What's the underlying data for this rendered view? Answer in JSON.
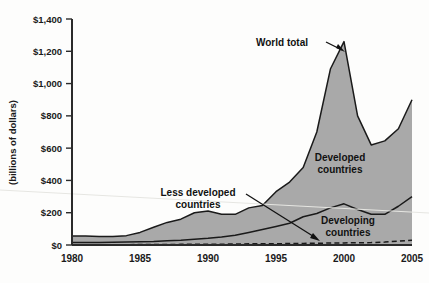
{
  "chart_data": {
    "type": "area",
    "title": "",
    "subtitle": "",
    "xlabel": "",
    "ylabel": "(billions of dollars)",
    "xlim": [
      1980,
      2005
    ],
    "ylim": [
      0,
      1400
    ],
    "grid": false,
    "legend_position": "inline-annotations",
    "stacked": true,
    "x": [
      1980,
      1981,
      1982,
      1983,
      1984,
      1985,
      1986,
      1987,
      1988,
      1989,
      1990,
      1991,
      1992,
      1993,
      1994,
      1995,
      1996,
      1997,
      1998,
      1999,
      2000,
      2001,
      2002,
      2003,
      2004,
      2005
    ],
    "y_tick_labels": [
      "$0",
      "$200",
      "$400",
      "$600",
      "$800",
      "$1,000",
      "$1,200",
      "$1,400"
    ],
    "y_tick_values": [
      0,
      200,
      400,
      600,
      800,
      1000,
      1200,
      1400
    ],
    "x_tick_labels": [
      "1980",
      "1985",
      "1990",
      "1995",
      "2000",
      "2005"
    ],
    "x_tick_values": [
      1980,
      1985,
      1990,
      1995,
      2000,
      2005
    ],
    "series": [
      {
        "name": "World total",
        "style": "solid-line-filled-area",
        "fill": "#a9a9a9",
        "values": [
          55,
          55,
          52,
          52,
          58,
          78,
          110,
          140,
          160,
          200,
          210,
          190,
          190,
          230,
          245,
          330,
          390,
          480,
          700,
          1090,
          1260,
          800,
          620,
          645,
          720,
          900
        ]
      },
      {
        "name": "Developing countries",
        "style": "solid-line",
        "fill": "#a9a9a9",
        "values": [
          15,
          15,
          16,
          17,
          18,
          20,
          22,
          26,
          30,
          36,
          42,
          50,
          60,
          78,
          96,
          115,
          135,
          175,
          195,
          230,
          255,
          220,
          190,
          190,
          240,
          300
        ]
      },
      {
        "name": "Less developed countries",
        "style": "dashed-line",
        "values": [
          2,
          2,
          2,
          2,
          2,
          3,
          3,
          3,
          4,
          4,
          5,
          5,
          6,
          7,
          7,
          8,
          9,
          10,
          11,
          12,
          13,
          14,
          15,
          18,
          24,
          30
        ]
      }
    ],
    "annotations": [
      {
        "text": "World total",
        "target_x": 2000,
        "target_y": 1260
      },
      {
        "text": "Less developed countries",
        "target_x": 1998,
        "target_y": 12
      },
      {
        "text": "Developed countries",
        "target_x": 2001,
        "target_y": 520
      },
      {
        "text": "Developing countries",
        "target_x": 2001,
        "target_y": 130
      }
    ]
  },
  "axis": {
    "y_title": "(billions of dollars)",
    "y_labels": [
      "$1,400",
      "$1,200",
      "$1,000",
      "$800",
      "$600",
      "$400",
      "$200",
      "$0"
    ],
    "x_labels": [
      "1980",
      "1985",
      "1990",
      "1995",
      "2000",
      "2005"
    ]
  },
  "annotations": {
    "world_total": "World total",
    "less_developed_line1": "Less developed",
    "less_developed_line2": "countries",
    "developed_line1": "Developed",
    "developed_line2": "countries",
    "developing_line1": "Developing",
    "developing_line2": "countries"
  },
  "colors": {
    "area_fill": "#a9a9a9",
    "line": "#1a1a1a",
    "axis": "#2b2b2b",
    "background": "#fdfdfc"
  }
}
